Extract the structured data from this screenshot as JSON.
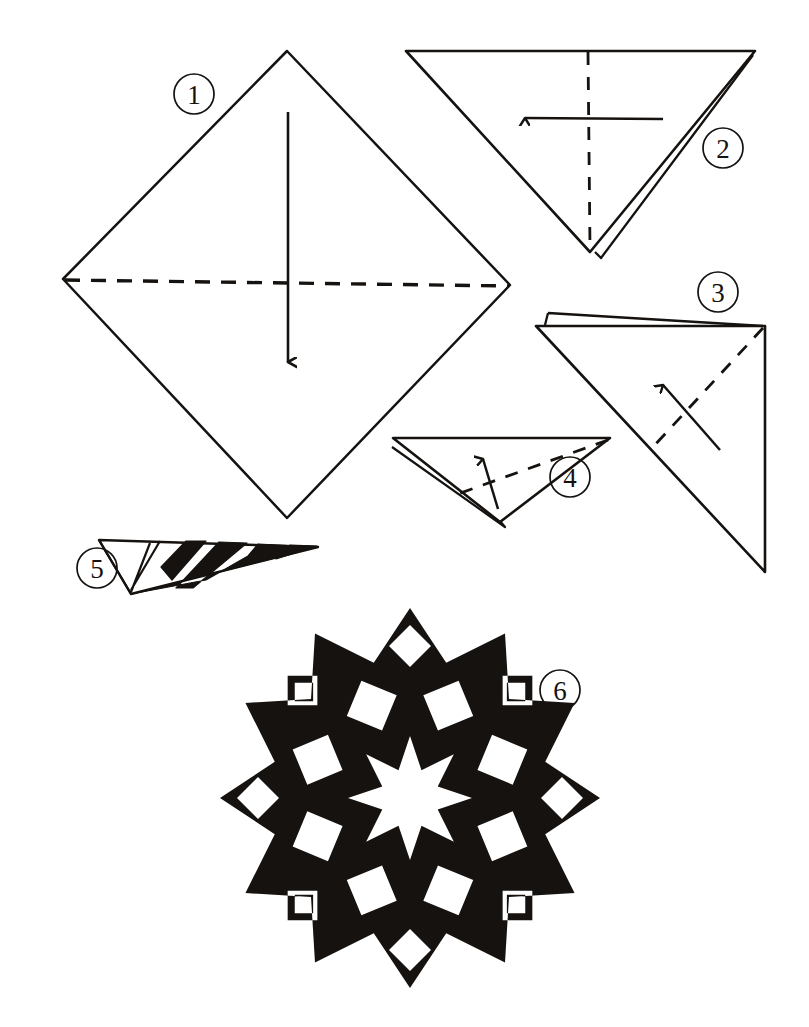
{
  "document": {
    "title": "Paper Snowflake Folding Instructions",
    "type": "illustrated step-by-step diagram",
    "medium": "hand-drawn ink line art on white paper",
    "ink_color": "#15120f",
    "paper_color": "#ffffff",
    "step_count": 6
  },
  "steps": [
    {
      "number": "1",
      "label_position": {
        "cx": 194,
        "cy": 94,
        "r": 20
      },
      "shape": "square rotated 45 degrees (diamond)",
      "fold_line": "horizontal dashed line across the diamond's widest points",
      "arrow": "straight solid arrow pointing down through the center",
      "caption": "Fold square in half downward along the horizontal diagonal"
    },
    {
      "number": "2",
      "label_position": {
        "cx": 723,
        "cy": 148,
        "r": 20
      },
      "shape": "downward-pointing triangle",
      "fold_line": "vertical dashed line from top edge midpoint to bottom apex",
      "arrow": "horizontal solid arrow pointing left",
      "caption": "Fold triangle in half to the left along the vertical"
    },
    {
      "number": "3",
      "label_position": {
        "cx": 718,
        "cy": 292,
        "r": 20
      },
      "shape": "right triangle with vertical right edge and layered top edge",
      "fold_line": "diagonal dashed line",
      "arrow": "diagonal solid arrow pointing up-left",
      "caption": "Fold again along the diagonal"
    },
    {
      "number": "4",
      "label_position": {
        "cx": 570,
        "cy": 477,
        "r": 20
      },
      "shape": "downward-pointing triangle with layered left edge",
      "fold_line": "diagonal dashed line",
      "arrow": "solid arrow pointing up",
      "caption": "Fold the narrow wedge over"
    },
    {
      "number": "5",
      "label_position": {
        "cx": 97,
        "cy": 568,
        "r": 20
      },
      "shape": "narrow folded wedge with black cut-away areas marked",
      "fold_line": "none",
      "arrow": "none",
      "caption": "Cut away the black areas from the folded wedge"
    },
    {
      "number": "6",
      "label_position": {
        "cx": 560,
        "cy": 690,
        "r": 20
      },
      "shape": "finished 12-pointed black snowflake with star and diamond cut-outs",
      "fold_line": "none",
      "arrow": "none",
      "caption": "Unfold to reveal the finished snowflake"
    }
  ],
  "snowflake": {
    "center": {
      "cx": 410,
      "cy": 798
    },
    "points": 12,
    "outer_radius": 190,
    "inner_radius": 140,
    "fill": "#15120f",
    "cutouts": {
      "center_star_points": 8,
      "center_star_outer_radius": 62,
      "center_star_inner_radius": 30,
      "diamond_rings": [
        {
          "ring_radius": 100,
          "count": 8,
          "size": 27,
          "rotation_offset": 22.5
        },
        {
          "ring_radius": 152,
          "count": 8,
          "size": 21,
          "rotation_offset": 0
        },
        {
          "ring_radius": 150,
          "count": 4,
          "size": 13,
          "rotation_offset": 45
        }
      ]
    }
  }
}
